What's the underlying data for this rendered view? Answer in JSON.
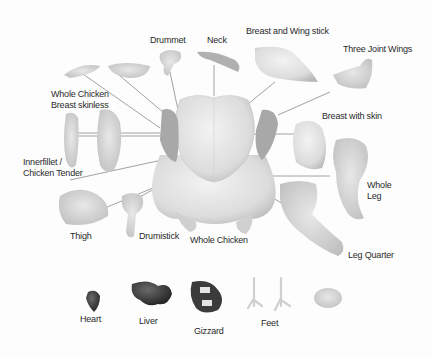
{
  "diagram": {
    "type": "labeled-illustration",
    "center": "Whole Chicken",
    "labels": [
      {
        "id": "drummet",
        "text": "Drummet",
        "x": 150,
        "y": 35
      },
      {
        "id": "neck",
        "text": "Neck",
        "x": 207,
        "y": 35
      },
      {
        "id": "breast-wing-stick",
        "text": "Breast and Wing stick",
        "x": 246,
        "y": 26
      },
      {
        "id": "three-joint-wings",
        "text": "Three Joint Wings",
        "x": 343,
        "y": 44
      },
      {
        "id": "whole-breast-skinless",
        "text": "Whole Chicken\nBreast skinless",
        "x": 51,
        "y": 89
      },
      {
        "id": "breast-with-skin",
        "text": "Breast with skin",
        "x": 322,
        "y": 111
      },
      {
        "id": "innerfillet",
        "text": "Innerfillet /\nChicken Tender",
        "x": 23,
        "y": 157
      },
      {
        "id": "whole-leg",
        "text": "Whole\nLeg",
        "x": 367,
        "y": 180
      },
      {
        "id": "thigh",
        "text": "Thigh",
        "x": 70,
        "y": 231
      },
      {
        "id": "drumstick",
        "text": "Drumistick",
        "x": 139,
        "y": 231
      },
      {
        "id": "whole-chicken",
        "text": "Whole Chicken",
        "x": 190,
        "y": 235
      },
      {
        "id": "leg-quarter",
        "text": "Leg Quarter",
        "x": 348,
        "y": 250
      },
      {
        "id": "heart",
        "text": "Heart",
        "x": 80,
        "y": 314
      },
      {
        "id": "liver",
        "text": "Liver",
        "x": 139,
        "y": 316
      },
      {
        "id": "gizzard",
        "text": "Gizzard",
        "x": 194,
        "y": 326
      },
      {
        "id": "feet",
        "text": "Feet",
        "x": 261,
        "y": 318
      }
    ],
    "colors": {
      "background": "#fdfdfd",
      "text": "#2a2a2a",
      "meat_light": "#e6e6e6",
      "meat_mid": "#cfcfcf",
      "meat_shadow": "#9a9a9a",
      "organ_dark": "#3a3a3a",
      "leader_line": "#8a8a8a"
    }
  }
}
